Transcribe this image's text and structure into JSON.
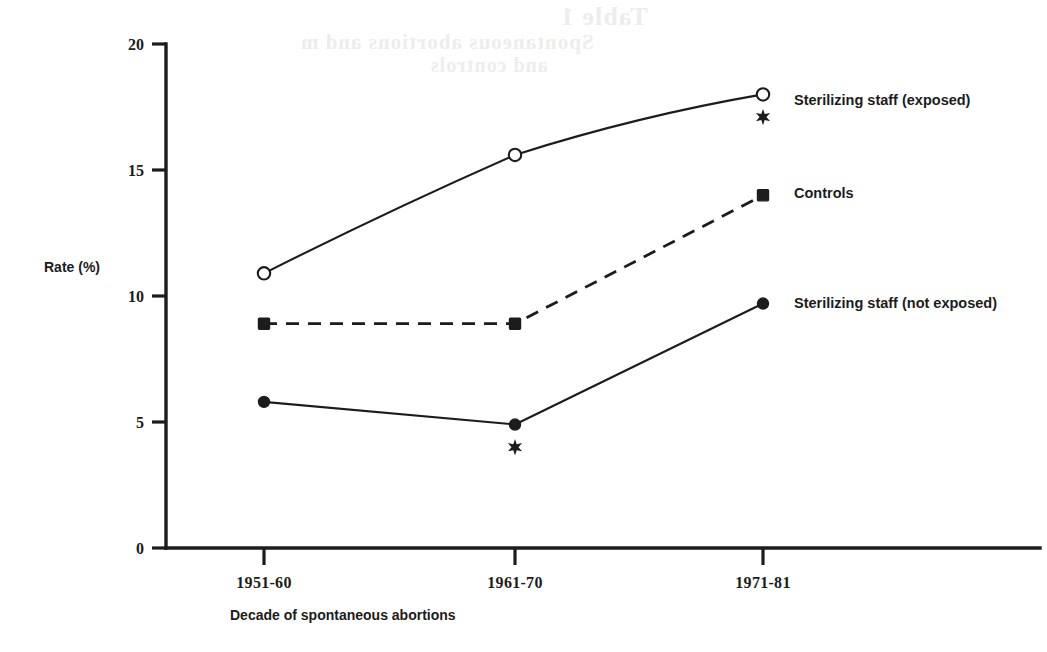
{
  "figure": {
    "ghost_artifacts": {
      "line1": "Table 1",
      "line2": "Spontaneous abortions and m",
      "line3": "and controls"
    }
  },
  "chart_data": {
    "type": "line",
    "title": "",
    "xlabel": "Decade of spontaneous abortions",
    "ylabel": "Rate (%)",
    "categories": [
      "1951-60",
      "1961-70",
      "1971-81"
    ],
    "ylim": [
      0,
      20
    ],
    "yticks": [
      "0",
      "5",
      "10",
      "15",
      "20"
    ],
    "ytick_values": [
      0,
      5,
      10,
      15,
      20
    ],
    "grid": false,
    "legend_position": "right-inline",
    "series": [
      {
        "name": "Sterilizing staff (exposed)",
        "values": [
          10.9,
          15.6,
          18.0
        ],
        "marker": "open-circle",
        "linestyle": "solid",
        "color": "#1c1c1c"
      },
      {
        "name": "Controls",
        "values": [
          8.9,
          8.9,
          14.0
        ],
        "marker": "filled-square",
        "linestyle": "dashed",
        "color": "#1c1c1c"
      },
      {
        "name": "Sterilizing staff (not exposed)",
        "values": [
          5.8,
          4.9,
          9.7
        ],
        "marker": "filled-circle",
        "linestyle": "solid",
        "color": "#1c1c1c"
      }
    ],
    "annotations": [
      {
        "symbol": "*",
        "category": "1961-70",
        "value": 4.0,
        "marker": "star"
      },
      {
        "symbol": "*",
        "category": "1971-81",
        "value": 17.1,
        "marker": "star"
      }
    ]
  }
}
